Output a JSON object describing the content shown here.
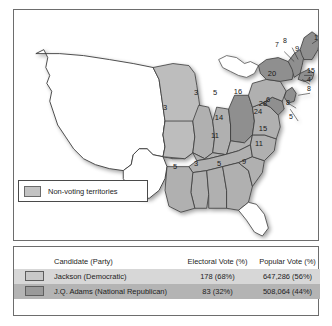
{
  "legend": {
    "label": "Non-voting territories",
    "swatch_color": "#c3c3c3"
  },
  "colors": {
    "jackson_fill": "#c8c8c8",
    "adams_fill": "#9a9a9a",
    "nonvoting_fill": "#ffffff",
    "row_jackson_bg": "#d7d7d7",
    "row_adams_bg": "#b4b4b4",
    "border": "#4a4a4a"
  },
  "map": {
    "state_labels": [
      {
        "id": "missouri",
        "value": "3",
        "x": 165,
        "y": 107
      },
      {
        "id": "illinois",
        "value": "3",
        "x": 196,
        "y": 92
      },
      {
        "id": "indiana",
        "value": "5",
        "x": 215,
        "y": 92
      },
      {
        "id": "ohio",
        "value": "16",
        "x": 238,
        "y": 91
      },
      {
        "id": "kentucky",
        "value": "14",
        "x": 219,
        "y": 117
      },
      {
        "id": "tennessee",
        "value": "11",
        "x": 215,
        "y": 135
      },
      {
        "id": "mississippi",
        "value": "3",
        "x": 196,
        "y": 163
      },
      {
        "id": "alabama",
        "value": "5",
        "x": 219,
        "y": 163
      },
      {
        "id": "georgia",
        "value": "9",
        "x": 244,
        "y": 161
      },
      {
        "id": "louisiana",
        "value": "5",
        "x": 175,
        "y": 166
      },
      {
        "id": "north-carolina",
        "value": "11",
        "x": 259,
        "y": 143
      },
      {
        "id": "virginia",
        "value": "24",
        "x": 258,
        "y": 111
      },
      {
        "id": "south-carolina",
        "value": "15",
        "x": 263,
        "y": 128
      },
      {
        "id": "pennsylvania",
        "value": "28",
        "x": 263,
        "y": 103
      },
      {
        "id": "new-york",
        "value": "20",
        "x": 272,
        "y": 73
      },
      {
        "id": "maryland",
        "value": "6",
        "x": 268,
        "y": 99
      },
      {
        "id": "maine",
        "value": "9",
        "x": 297,
        "y": 48
      }
    ],
    "leader_labels": [
      {
        "id": "vermont",
        "value": "7",
        "x": 277,
        "y": 43
      },
      {
        "id": "new-hampshire",
        "value": "8",
        "x": 285,
        "y": 39
      },
      {
        "id": "massachusetts",
        "value": "1",
        "x": 316,
        "y": 36
      },
      {
        "id": "rhode-island",
        "value": "15",
        "x": 311,
        "y": 69
      },
      {
        "id": "connecticut",
        "value": "4",
        "x": 309,
        "y": 78
      },
      {
        "id": "new-jersey",
        "value": "8",
        "x": 309,
        "y": 87
      },
      {
        "id": "delaware-a",
        "value": "8",
        "x": 288,
        "y": 101
      },
      {
        "id": "delaware-b",
        "value": "5",
        "x": 291,
        "y": 115
      }
    ]
  },
  "results_table": {
    "headers": {
      "candidate": "Candidate (Party)",
      "electoral": "Electoral Vote (%)",
      "popular": "Popular Vote (%)"
    },
    "rows": [
      {
        "candidate": "Jackson (Democratic)",
        "electoral": "178 (68%)",
        "popular": "647,286 (56%)",
        "swatch": "light"
      },
      {
        "candidate": "J.Q. Adams (National Republican)",
        "electoral": "83 (32%)",
        "popular": "508,064 (44%)",
        "swatch": "dark"
      }
    ]
  }
}
